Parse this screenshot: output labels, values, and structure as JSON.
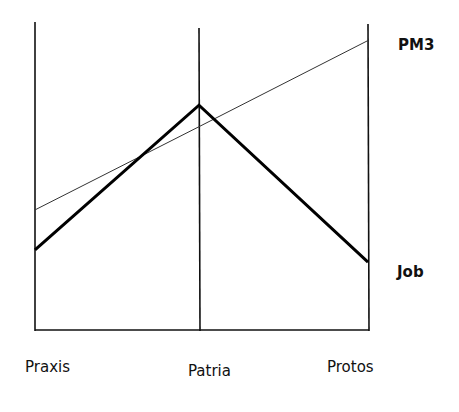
{
  "chart_data": {
    "type": "line",
    "title": "",
    "xlabel": "",
    "ylabel": "",
    "categories": [
      "Praxis",
      "Patria",
      "Protos"
    ],
    "series": [
      {
        "name": "PM3",
        "values": [
          39,
          66,
          94
        ],
        "style": "thin"
      },
      {
        "name": "Job",
        "values": [
          26,
          73,
          22
        ],
        "style": "thick"
      }
    ],
    "ylim": [
      0,
      100
    ],
    "grid": false,
    "legend_position": "right (labels at line ends)"
  },
  "labels": {
    "x": [
      "Praxis",
      "Patria",
      "Protos"
    ],
    "series": [
      "PM3",
      "Job"
    ]
  }
}
